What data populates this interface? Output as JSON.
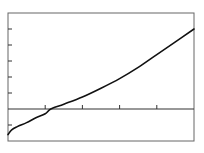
{
  "chart_data": {
    "type": "line",
    "title": "",
    "xlabel": "",
    "ylabel": "",
    "xlim": [
      0,
      5
    ],
    "ylim": [
      -2,
      6
    ],
    "grid": false,
    "legend": null,
    "x_ticks": [
      1,
      2,
      3,
      4
    ],
    "y_ticks": [
      -1,
      1,
      2,
      3,
      4,
      5
    ],
    "tick_labels_visible": false,
    "zero_line": true,
    "series": [
      {
        "name": "curve",
        "color": "#111111",
        "x": [
          0,
          0.1,
          0.25,
          0.5,
          0.75,
          1.0,
          1.15,
          1.5,
          2.0,
          2.5,
          3.0,
          3.5,
          4.0,
          4.5,
          5.0
        ],
        "y": [
          -1.6,
          -1.3,
          -1.1,
          -0.85,
          -0.55,
          -0.3,
          0.0,
          0.3,
          0.75,
          1.3,
          1.9,
          2.6,
          3.4,
          4.2,
          5.0
        ]
      }
    ]
  },
  "caption": "",
  "colors": {
    "frame": "#555555",
    "axis": "#333333",
    "curve": "#111111",
    "background": "#ffffff"
  }
}
